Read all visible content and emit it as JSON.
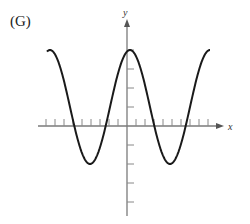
{
  "figure_label": "(G)",
  "chart_data": {
    "type": "line",
    "title": "",
    "xlabel": "x",
    "ylabel": "y",
    "function_description": "cosine wave: y = 1 + 3cos(kx), max 4 at x=0, min -2",
    "x_ticks_count": 19,
    "y_ticks_above": 4,
    "y_ticks_below": 4,
    "ylim": [
      -4,
      4
    ],
    "series": [
      {
        "name": "curve",
        "points_px": [
          [
            47,
            50
          ],
          [
            91,
            164
          ],
          [
            130,
            50
          ],
          [
            170,
            164
          ],
          [
            210,
            50
          ]
        ],
        "maxima_y_units": 4,
        "minima_y_units": -2
      }
    ],
    "grid": false,
    "legend": null
  },
  "colors": {
    "curve": "#1a1a1a",
    "axis": "#7a7a7a"
  }
}
